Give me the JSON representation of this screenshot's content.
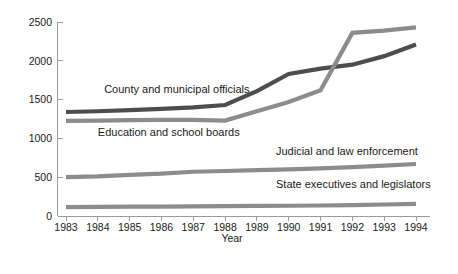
{
  "chart_data": {
    "type": "line",
    "title": "",
    "xlabel": "Year",
    "ylabel": "",
    "x": [
      1983,
      1984,
      1985,
      1986,
      1987,
      1988,
      1989,
      1990,
      1991,
      1992,
      1993,
      1994
    ],
    "categories": [
      "1983",
      "1984",
      "1985",
      "1986",
      "1987",
      "1988",
      "1989",
      "1990",
      "1991",
      "1992",
      "1993",
      "1994"
    ],
    "ylim": [
      0,
      2500
    ],
    "xlim": [
      1983,
      1994
    ],
    "yticks": [
      0,
      500,
      1000,
      1500,
      2000,
      2500
    ],
    "ytick_labels": [
      "0",
      "500",
      "1000",
      "1500",
      "2000",
      "2500"
    ],
    "grid": false,
    "legend": "inline-labels",
    "series": [
      {
        "name": "County and municipal officials",
        "color": "#4d4d4d",
        "label_x": 1984.2,
        "label_y": 1580,
        "values": [
          1340,
          1350,
          1365,
          1380,
          1400,
          1430,
          1610,
          1830,
          1900,
          1950,
          2060,
          2210
        ]
      },
      {
        "name": "Education and school boards",
        "color": "#8c8c8c",
        "label_x": 1984.0,
        "label_y": 1030,
        "values": [
          1225,
          1230,
          1235,
          1240,
          1240,
          1230,
          1350,
          1470,
          1620,
          2360,
          2390,
          2430
        ]
      },
      {
        "name": "Judicial and law enforcement",
        "color": "#8c8c8c",
        "label_x": 1989.6,
        "label_y": 790,
        "values": [
          500,
          510,
          530,
          545,
          570,
          580,
          590,
          600,
          615,
          630,
          650,
          670
        ]
      },
      {
        "name": "State executives and legislators",
        "color": "#8c8c8c",
        "label_x": 1989.6,
        "label_y": 360,
        "values": [
          115,
          118,
          120,
          122,
          125,
          127,
          130,
          132,
          135,
          140,
          148,
          155
        ]
      }
    ]
  },
  "axis": {
    "x_title": "Year"
  }
}
